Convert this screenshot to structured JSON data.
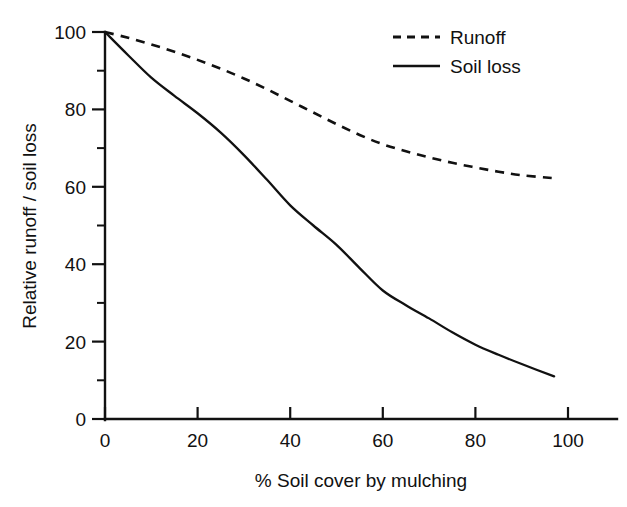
{
  "chart_data": {
    "type": "line",
    "title": "",
    "xlabel": "% Soil cover by mulching",
    "ylabel": "Relative runoff / soil loss",
    "xlim": [
      0,
      113
    ],
    "ylim": [
      0,
      103
    ],
    "grid": false,
    "legend_position": "top-right",
    "x_ticks": [
      0,
      20,
      40,
      60,
      80,
      100
    ],
    "x_tick_labels": [
      "0",
      "20",
      "40",
      "60",
      "80",
      "100"
    ],
    "x_minor_ticks": [],
    "y_ticks": [
      0,
      20,
      40,
      60,
      80,
      100
    ],
    "y_tick_labels": [
      "0",
      "20",
      "40",
      "60",
      "80",
      "100"
    ],
    "y_minor_ticks": [
      10,
      30,
      50,
      70,
      90
    ],
    "x": [
      0,
      5,
      10,
      15,
      20,
      25,
      30,
      35,
      40,
      45,
      50,
      55,
      60,
      65,
      70,
      75,
      80,
      85,
      90,
      97
    ],
    "series": [
      {
        "name": "Runoff",
        "style": "dashed",
        "color": "#111111",
        "values": [
          100,
          98.5,
          96.8,
          94.9,
          92.8,
          90.5,
          88.0,
          85.2,
          82.2,
          79.2,
          76.2,
          73.4,
          71.0,
          69.2,
          67.6,
          66.2,
          65.0,
          63.9,
          63.0,
          62.2
        ]
      },
      {
        "name": "Soil loss",
        "style": "solid",
        "color": "#111111",
        "values": [
          100,
          94.0,
          88.2,
          83.5,
          79.0,
          74.0,
          68.2,
          61.8,
          55.2,
          50.0,
          45.0,
          39.0,
          33.2,
          29.4,
          26.0,
          22.4,
          19.2,
          16.6,
          14.2,
          11.0
        ]
      }
    ],
    "legend": [
      {
        "label": "Runoff",
        "style": "dashed"
      },
      {
        "label": "Soil loss",
        "style": "solid"
      }
    ]
  }
}
